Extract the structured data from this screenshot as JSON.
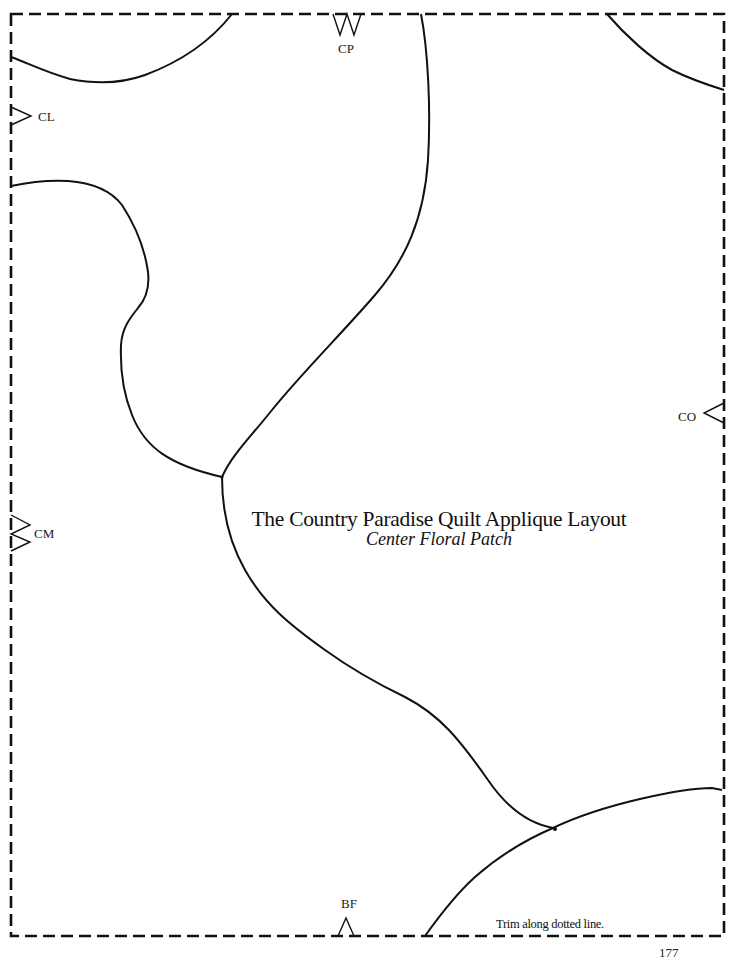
{
  "document": {
    "title": "The Country Paradise Quilt Applique Layout",
    "subtitle": "Center Floral Patch",
    "trim_instruction": "Trim along dotted line.",
    "page_number": "177"
  },
  "alignment_marks": [
    {
      "id": "CP",
      "label": "CP",
      "edge": "top",
      "shape": "double-notch"
    },
    {
      "id": "CL",
      "label": "CL",
      "edge": "left",
      "shape": "single-notch"
    },
    {
      "id": "CM",
      "label": "CM",
      "edge": "left",
      "shape": "double-notch"
    },
    {
      "id": "CO",
      "label": "CO",
      "edge": "right",
      "shape": "single-notch"
    },
    {
      "id": "BF",
      "label": "BF",
      "edge": "bottom",
      "shape": "single-notch"
    }
  ],
  "colors": {
    "line": "#111111",
    "background": "#ffffff"
  }
}
